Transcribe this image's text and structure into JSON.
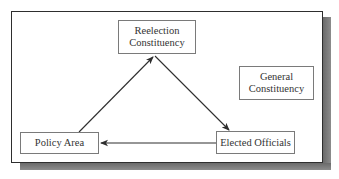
{
  "diagram": {
    "nodes": {
      "reelection": {
        "line1": "Reelection",
        "line2": "Constituency"
      },
      "general": {
        "line1": "General",
        "line2": "Constituency"
      },
      "policy": {
        "label": "Policy Area"
      },
      "officials": {
        "label": "Elected Officials"
      }
    },
    "edges": [
      {
        "from": "Policy Area",
        "to": "Reelection Constituency"
      },
      {
        "from": "Reelection Constituency",
        "to": "Elected Officials"
      },
      {
        "from": "Elected Officials",
        "to": "Policy Area"
      }
    ],
    "colors": {
      "line": "#2e2e2e",
      "box_border": "#7a7a7a",
      "shadow": "#7a7a7a",
      "text": "#333333"
    }
  }
}
